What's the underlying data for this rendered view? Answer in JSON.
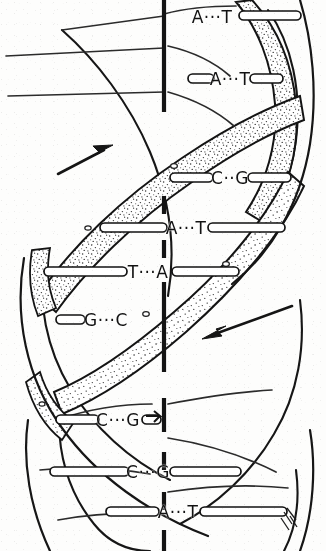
{
  "figure": {
    "background_color": "#fdfdfc",
    "ink_color": "#111111",
    "ribbon_fill": "#ffffff",
    "ribbon_stipple_color": "#3a3a3a"
  },
  "axis": {
    "name": "central-helical-axis",
    "style": "dashed",
    "x": 164,
    "color": "#141414",
    "segments": [
      {
        "y1": 0,
        "y2": 112
      },
      {
        "y1": 196,
        "y2": 214
      },
      {
        "y1": 240,
        "y2": 258
      },
      {
        "y1": 282,
        "y2": 372
      },
      {
        "y1": 398,
        "y2": 432
      },
      {
        "y1": 452,
        "y2": 470
      },
      {
        "y1": 492,
        "y2": 510
      },
      {
        "y1": 530,
        "y2": 551
      }
    ]
  },
  "arrows": [
    {
      "name": "arrow-strand-up",
      "label": "",
      "direction": "up-right",
      "x1": 58,
      "y1": 174,
      "x2": 110,
      "y2": 147,
      "color": "#151515"
    },
    {
      "name": "arrow-strand-down",
      "label": "",
      "direction": "down-left",
      "x1": 292,
      "y1": 306,
      "x2": 204,
      "y2": 338,
      "color": "#151515"
    }
  ],
  "base_pairs": [
    {
      "id": "bp-1",
      "label": "A···T",
      "left_base": "A",
      "right_base": "T",
      "bond_dots": 3,
      "x": 212,
      "y": 17,
      "rung_left": false,
      "rung_right": true,
      "rung_right_x1": 239,
      "rung_right_x2": 300,
      "clipped": true
    },
    {
      "id": "bp-2",
      "label": "A···T",
      "left_base": "A",
      "right_base": "T",
      "bond_dots": 3,
      "x": 230,
      "y": 79,
      "rung_left": true,
      "rung_left_x1": 188,
      "rung_left_x2": 212,
      "rung_right": true,
      "rung_right_x1": 250,
      "rung_right_x2": 282,
      "clipped": false
    },
    {
      "id": "bp-3",
      "label": "C··G",
      "left_base": "C",
      "right_base": "G",
      "bond_dots": 2,
      "x": 230,
      "y": 178,
      "rung_left": true,
      "rung_left_x1": 170,
      "rung_left_x2": 212,
      "rung_right": true,
      "rung_right_x1": 248,
      "rung_right_x2": 290,
      "clipped": false
    },
    {
      "id": "bp-4",
      "label": "A···T",
      "left_base": "A",
      "right_base": "T",
      "bond_dots": 3,
      "x": 186,
      "y": 228,
      "rung_left": true,
      "rung_left_x1": 100,
      "rung_left_x2": 166,
      "rung_right": true,
      "rung_right_x1": 208,
      "rung_right_x2": 284,
      "clipped": false
    },
    {
      "id": "bp-5",
      "label": "T···A",
      "left_base": "T",
      "right_base": "A",
      "bond_dots": 3,
      "x": 148,
      "y": 272,
      "rung_left": true,
      "rung_left_x1": 44,
      "rung_left_x2": 126,
      "rung_right": true,
      "rung_right_x1": 172,
      "rung_right_x2": 238,
      "clipped": false
    },
    {
      "id": "bp-6",
      "label": "G···C",
      "left_base": "G",
      "right_base": "C",
      "bond_dots": 3,
      "x": 106,
      "y": 320,
      "rung_left": true,
      "rung_left_x1": 56,
      "rung_left_x2": 84,
      "rung_right": false,
      "clipped": false
    },
    {
      "id": "bp-7",
      "label": "C···G",
      "left_base": "C",
      "right_base": "G",
      "bond_dots": 3,
      "x": 118,
      "y": 420,
      "rung_left": true,
      "rung_left_x1": 56,
      "rung_left_x2": 98,
      "rung_right": true,
      "rung_right_x1": 142,
      "rung_right_x2": 160,
      "clipped": false
    },
    {
      "id": "bp-8",
      "label": "C···G",
      "left_base": "C",
      "right_base": "G",
      "bond_dots": 3,
      "x": 148,
      "y": 472,
      "rung_left": true,
      "rung_left_x1": 50,
      "rung_left_x2": 128,
      "rung_right": true,
      "rung_right_x1": 170,
      "rung_right_x2": 240,
      "clipped": false
    },
    {
      "id": "bp-9",
      "label": "A···T",
      "left_base": "A",
      "right_base": "T",
      "bond_dots": 3,
      "x": 178,
      "y": 512,
      "rung_left": true,
      "rung_left_x1": 106,
      "rung_left_x2": 158,
      "rung_right": true,
      "rung_right_x1": 200,
      "rung_right_x2": 286,
      "clipped": false
    }
  ],
  "backbone_strands": [
    {
      "name": "strand-front-shaded",
      "style": "stippled-ribbon",
      "description": "Front sugar-phosphate backbone drawn as a broad stippled ribbon spiralling from lower-left to upper-right."
    },
    {
      "name": "strand-back-plain",
      "style": "plain-line",
      "description": "Rear sugar-phosphate backbone drawn as plain curved outline."
    }
  ]
}
